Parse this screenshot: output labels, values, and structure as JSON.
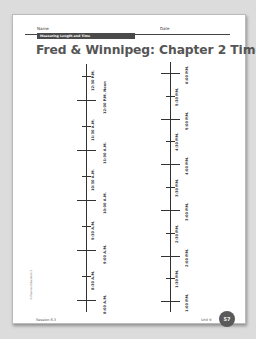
{
  "header": {
    "name_label": "Name",
    "date_label": "Date",
    "band_text": "Measuring Length and Time"
  },
  "title": "Fred & Winnipeg: Chapter 2 Timeline",
  "left_timeline": {
    "labels": [
      "12:30 P.M.",
      "12:00 P.M. Noon",
      "11:30 A.M.",
      "11:00 A.M.",
      "10:30 A.M.",
      "10:00 A.M.",
      "9:30 A.M.",
      "9:00 A.M.",
      "8:30 A.M.",
      "8:00 A.M."
    ]
  },
  "right_timeline": {
    "labels": [
      "6:00 P.M.",
      "5:30 P.M.",
      "5:00 P.M.",
      "4:30 P.M.",
      "4:00 P.M.",
      "3:30 P.M.",
      "3:00 P.M.",
      "2:30 P.M.",
      "2:00 P.M.",
      "1:30 P.M.",
      "1:00 P.M."
    ]
  },
  "footer": {
    "session": "Session 8.3",
    "unit": "Unit 9",
    "page_number": "57",
    "copyright": "© Pearson Education 3"
  }
}
